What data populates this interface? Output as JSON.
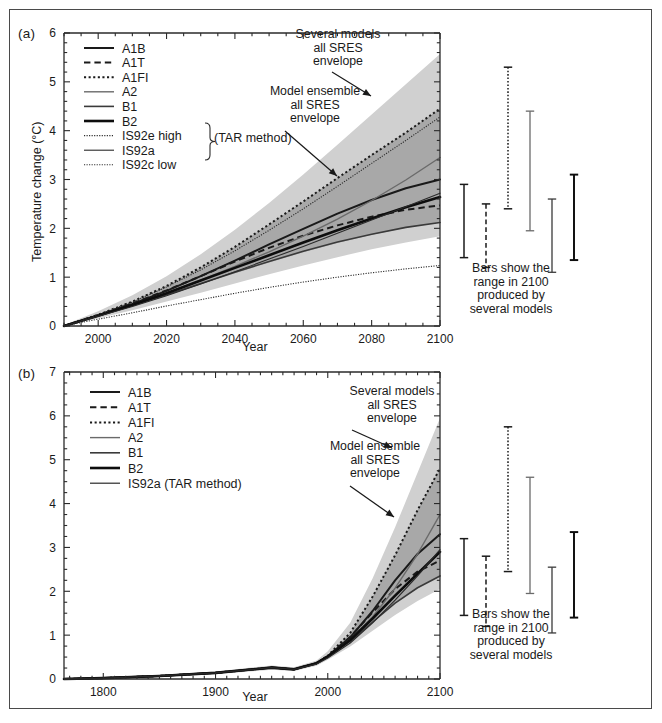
{
  "figure": {
    "background_color": "#ffffff",
    "border_color": "#4a4a4a",
    "envelope_outer_color": "#d0d0d0",
    "envelope_inner_color": "#a8a8a8",
    "line_color": "#1a1a1a"
  },
  "panel_a": {
    "label": "(a)",
    "xlabel": "Year",
    "ylabel": "Temperature change (°C)",
    "xticks": [
      "2000",
      "2020",
      "2040",
      "2060",
      "2080",
      "2100"
    ],
    "yticks": [
      "0",
      "1",
      "2",
      "3",
      "4",
      "5",
      "6"
    ],
    "legend": [
      {
        "label": "A1B",
        "style": "solid",
        "width": 2.0,
        "color": "#1a1a1a"
      },
      {
        "label": "A1T",
        "style": "dashed",
        "width": 2.0,
        "color": "#1a1a1a"
      },
      {
        "label": "A1FI",
        "style": "dotted",
        "width": 2.0,
        "color": "#1a1a1a"
      },
      {
        "label": "A2",
        "style": "solid",
        "width": 1.4,
        "color": "#6a6a6a"
      },
      {
        "label": "B1",
        "style": "solid",
        "width": 1.6,
        "color": "#3a3a3a"
      },
      {
        "label": "B2",
        "style": "solid",
        "width": 2.6,
        "color": "#0d0d0d"
      },
      {
        "label": "IS92e high",
        "style": "dotted",
        "width": 1.1,
        "color": "#2a2a2a"
      },
      {
        "label": "IS92a",
        "style": "solid",
        "width": 1.1,
        "color": "#2a2a2a"
      },
      {
        "label": "IS92c low",
        "style": "dotted",
        "width": 1.1,
        "color": "#2a2a2a"
      }
    ],
    "brace_label": "(TAR method)",
    "annotations": [
      {
        "name": "several-models-annotation",
        "text": "Several models\nall SRES\nenvelope"
      },
      {
        "name": "model-ensemble-annotation",
        "text": "Model ensemble\nall SRES\nenvelope"
      }
    ],
    "bars_caption": "Bars show the\nrange in 2100\nproduced by\nseveral models"
  },
  "panel_b": {
    "label": "(b)",
    "xlabel": "Year",
    "ylabel": "Temperature change (°C)",
    "xticks": [
      "1800",
      "1900",
      "2000",
      "2100"
    ],
    "yticks": [
      "0",
      "1",
      "2",
      "3",
      "4",
      "5",
      "6",
      "7"
    ],
    "legend": [
      {
        "label": "A1B",
        "style": "solid",
        "width": 2.0,
        "color": "#1a1a1a"
      },
      {
        "label": "A1T",
        "style": "dashed",
        "width": 2.0,
        "color": "#1a1a1a"
      },
      {
        "label": "A1FI",
        "style": "dotted",
        "width": 2.0,
        "color": "#1a1a1a"
      },
      {
        "label": "A2",
        "style": "solid",
        "width": 1.4,
        "color": "#6a6a6a"
      },
      {
        "label": "B1",
        "style": "solid",
        "width": 1.6,
        "color": "#3a3a3a"
      },
      {
        "label": "B2",
        "style": "solid",
        "width": 2.6,
        "color": "#0d0d0d"
      },
      {
        "label": "IS92a (TAR method)",
        "style": "solid",
        "width": 1.2,
        "color": "#2a2a2a"
      }
    ],
    "annotations": [
      {
        "name": "several-models-annotation",
        "text": "Several models\nall SRES\nenvelope"
      },
      {
        "name": "model-ensemble-annotation",
        "text": "Model ensemble\nall SRES\nenvelope"
      }
    ],
    "bars_caption": "Bars show the\nrange in 2100\nproduced by\nseveral models"
  },
  "chart_data": [
    {
      "type": "line",
      "name": "panel-a-sres-projections",
      "title": "(a)",
      "xlabel": "Year",
      "ylabel": "Temperature change (°C)",
      "xlim": [
        1990,
        2100
      ],
      "ylim": [
        0,
        6
      ],
      "xticks": [
        2000,
        2020,
        2040,
        2060,
        2080,
        2100
      ],
      "yticks": [
        0,
        1,
        2,
        3,
        4,
        5,
        6
      ],
      "grid": false,
      "legend_position": "upper-left",
      "x": [
        1990,
        2000,
        2010,
        2020,
        2030,
        2040,
        2050,
        2060,
        2070,
        2080,
        2090,
        2100
      ],
      "series": [
        {
          "name": "A1B",
          "style": "solid",
          "values": [
            0.0,
            0.22,
            0.45,
            0.72,
            1.02,
            1.34,
            1.67,
            1.99,
            2.3,
            2.58,
            2.82,
            3.0
          ]
        },
        {
          "name": "A1T",
          "style": "dashed",
          "values": [
            0.0,
            0.22,
            0.46,
            0.73,
            1.02,
            1.32,
            1.6,
            1.85,
            2.06,
            2.24,
            2.38,
            2.47
          ]
        },
        {
          "name": "A1FI",
          "style": "dotted",
          "values": [
            0.0,
            0.23,
            0.5,
            0.82,
            1.2,
            1.62,
            2.08,
            2.55,
            3.03,
            3.5,
            3.96,
            4.45
          ]
        },
        {
          "name": "A2",
          "style": "solid",
          "values": [
            0.0,
            0.21,
            0.43,
            0.68,
            0.94,
            1.22,
            1.52,
            1.84,
            2.19,
            2.57,
            2.99,
            3.45
          ]
        },
        {
          "name": "B1",
          "style": "solid",
          "values": [
            0.0,
            0.21,
            0.42,
            0.64,
            0.87,
            1.1,
            1.32,
            1.53,
            1.72,
            1.88,
            2.02,
            2.12
          ]
        },
        {
          "name": "B2",
          "style": "solid",
          "values": [
            0.0,
            0.21,
            0.43,
            0.67,
            0.93,
            1.19,
            1.45,
            1.71,
            1.96,
            2.2,
            2.43,
            2.64
          ]
        },
        {
          "name": "IS92e high",
          "style": "dotted",
          "values": [
            0.0,
            0.23,
            0.49,
            0.8,
            1.15,
            1.54,
            1.96,
            2.4,
            2.86,
            3.33,
            3.8,
            4.28
          ]
        },
        {
          "name": "IS92a",
          "style": "solid",
          "values": [
            0.0,
            0.2,
            0.4,
            0.62,
            0.86,
            1.11,
            1.37,
            1.63,
            1.9,
            2.17,
            2.44,
            2.72
          ]
        },
        {
          "name": "IS92c low",
          "style": "dotted",
          "values": [
            0.0,
            0.14,
            0.27,
            0.41,
            0.54,
            0.67,
            0.79,
            0.9,
            1.0,
            1.09,
            1.17,
            1.24
          ]
        }
      ],
      "bands": [
        {
          "name": "several-models-all-SRES-envelope",
          "upper": [
            0.02,
            0.3,
            0.63,
            1.02,
            1.47,
            1.97,
            2.52,
            3.1,
            3.71,
            4.33,
            4.95,
            5.57
          ],
          "lower": [
            0.0,
            0.16,
            0.32,
            0.5,
            0.68,
            0.87,
            1.06,
            1.24,
            1.41,
            1.57,
            1.71,
            1.84
          ]
        },
        {
          "name": "model-ensemble-all-SRES-envelope",
          "upper": [
            0.0,
            0.23,
            0.5,
            0.82,
            1.2,
            1.62,
            2.08,
            2.55,
            3.03,
            3.5,
            3.96,
            4.45
          ],
          "lower": [
            0.0,
            0.2,
            0.4,
            0.62,
            0.85,
            1.08,
            1.3,
            1.51,
            1.7,
            1.87,
            2.01,
            2.12
          ]
        }
      ],
      "bars": [
        {
          "name": "A1B",
          "style": "solid",
          "low": 1.4,
          "high": 2.9,
          "x_offset": 0
        },
        {
          "name": "A1T",
          "style": "dashed",
          "low": 1.2,
          "high": 2.5,
          "x_offset": 1
        },
        {
          "name": "A1FI",
          "style": "dotted",
          "low": 2.4,
          "high": 5.3,
          "x_offset": 2
        },
        {
          "name": "A2",
          "style": "solid",
          "low": 1.95,
          "high": 4.4,
          "x_offset": 3
        },
        {
          "name": "B1",
          "style": "solid",
          "low": 1.1,
          "high": 2.6,
          "x_offset": 4
        },
        {
          "name": "B2",
          "style": "solid",
          "low": 1.35,
          "high": 3.1,
          "x_offset": 5
        }
      ]
    },
    {
      "type": "line",
      "name": "panel-b-historical-and-projections",
      "title": "(b)",
      "xlabel": "Year",
      "ylabel": "Temperature change (°C)",
      "xlim": [
        1765,
        2100
      ],
      "ylim": [
        0,
        7
      ],
      "xticks": [
        1800,
        1900,
        2000,
        2100
      ],
      "yticks": [
        0,
        1,
        2,
        3,
        4,
        5,
        6,
        7
      ],
      "grid": false,
      "legend_position": "upper-left",
      "x": [
        1765,
        1800,
        1850,
        1900,
        1950,
        1970,
        1990,
        2000,
        2020,
        2040,
        2060,
        2080,
        2100
      ],
      "series": [
        {
          "name": "A1B",
          "style": "solid",
          "values": [
            0.0,
            0.02,
            0.07,
            0.14,
            0.26,
            0.22,
            0.36,
            0.52,
            0.95,
            1.55,
            2.25,
            2.85,
            3.3
          ]
        },
        {
          "name": "A1T",
          "style": "dashed",
          "values": [
            0.0,
            0.02,
            0.07,
            0.14,
            0.26,
            0.22,
            0.36,
            0.52,
            0.96,
            1.52,
            2.05,
            2.45,
            2.7
          ]
        },
        {
          "name": "A1FI",
          "style": "dotted",
          "values": [
            0.0,
            0.02,
            0.07,
            0.14,
            0.26,
            0.22,
            0.36,
            0.53,
            1.05,
            1.88,
            2.82,
            3.85,
            4.8
          ]
        },
        {
          "name": "A2",
          "style": "solid",
          "values": [
            0.0,
            0.02,
            0.07,
            0.14,
            0.26,
            0.22,
            0.36,
            0.51,
            0.9,
            1.42,
            2.07,
            2.85,
            3.75
          ]
        },
        {
          "name": "B1",
          "style": "solid",
          "values": [
            0.0,
            0.02,
            0.07,
            0.14,
            0.26,
            0.22,
            0.36,
            0.51,
            0.86,
            1.3,
            1.73,
            2.08,
            2.35
          ]
        },
        {
          "name": "B2",
          "style": "solid",
          "values": [
            0.0,
            0.02,
            0.07,
            0.14,
            0.26,
            0.22,
            0.36,
            0.51,
            0.89,
            1.38,
            1.9,
            2.4,
            2.9
          ]
        },
        {
          "name": "IS92a (TAR method)",
          "style": "solid",
          "values": [
            0.0,
            0.02,
            0.07,
            0.14,
            0.26,
            0.22,
            0.34,
            0.48,
            0.82,
            1.28,
            1.8,
            2.35,
            2.95
          ]
        }
      ],
      "bands": [
        {
          "name": "several-models-all-SRES-envelope",
          "upper": [
            0.0,
            0.03,
            0.09,
            0.17,
            0.31,
            0.27,
            0.42,
            0.63,
            1.28,
            2.3,
            3.46,
            4.7,
            5.95
          ],
          "lower": [
            0.0,
            0.01,
            0.05,
            0.11,
            0.21,
            0.18,
            0.3,
            0.44,
            0.74,
            1.1,
            1.46,
            1.78,
            2.05
          ]
        },
        {
          "name": "model-ensemble-all-SRES-envelope",
          "upper": [
            0.0,
            0.02,
            0.07,
            0.14,
            0.26,
            0.22,
            0.36,
            0.53,
            1.05,
            1.88,
            2.82,
            3.85,
            4.8
          ],
          "lower": [
            0.0,
            0.02,
            0.07,
            0.14,
            0.26,
            0.22,
            0.36,
            0.51,
            0.86,
            1.3,
            1.73,
            2.08,
            2.35
          ]
        }
      ],
      "bars": [
        {
          "name": "A1B",
          "style": "solid",
          "low": 1.45,
          "high": 3.2,
          "x_offset": 0
        },
        {
          "name": "A1T",
          "style": "dashed",
          "low": 1.2,
          "high": 2.8,
          "x_offset": 1
        },
        {
          "name": "A1FI",
          "style": "dotted",
          "low": 2.45,
          "high": 5.75,
          "x_offset": 2
        },
        {
          "name": "A2",
          "style": "solid",
          "low": 1.95,
          "high": 4.6,
          "x_offset": 3
        },
        {
          "name": "B1",
          "style": "solid",
          "low": 1.05,
          "high": 2.55,
          "x_offset": 4
        },
        {
          "name": "B2",
          "style": "solid",
          "low": 1.4,
          "high": 3.35,
          "x_offset": 5
        }
      ]
    }
  ]
}
